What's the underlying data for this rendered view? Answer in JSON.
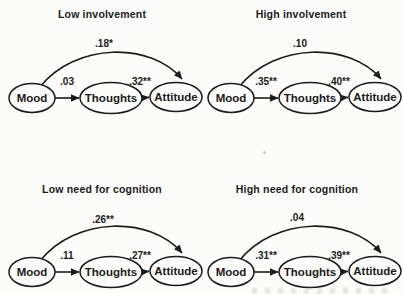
{
  "figure": {
    "paper_color": "#fcfcfa",
    "ink_color": "#1b1b1b",
    "panels": [
      {
        "title": "Low involvement",
        "nodes": {
          "mood": "Mood",
          "thoughts": "Thoughts",
          "attitude": "Attitude"
        },
        "paths": {
          "mood_thoughts": ".03",
          "thoughts_attitude": ".32**",
          "mood_attitude_curved": ".18*"
        }
      },
      {
        "title": "High involvement",
        "nodes": {
          "mood": "Mood",
          "thoughts": "Thoughts",
          "attitude": "Attitude"
        },
        "paths": {
          "mood_thoughts": ".35**",
          "thoughts_attitude": ".40**",
          "mood_attitude_curved": ".10"
        }
      },
      {
        "title": "Low need for cognition",
        "nodes": {
          "mood": "Mood",
          "thoughts": "Thoughts",
          "attitude": "Attitude"
        },
        "paths": {
          "mood_thoughts": ".11",
          "thoughts_attitude": ".27**",
          "mood_attitude_curved": ".26**"
        }
      },
      {
        "title": "High need for cognition",
        "nodes": {
          "mood": "Mood",
          "thoughts": "Thoughts",
          "attitude": "Attitude"
        },
        "paths": {
          "mood_thoughts": ".31**",
          "thoughts_attitude": ".39**",
          "mood_attitude_curved": ".04"
        }
      }
    ]
  }
}
